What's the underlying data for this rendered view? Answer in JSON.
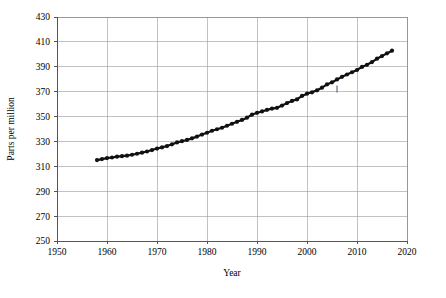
{
  "chart_data": {
    "type": "scatter",
    "title": "",
    "subtitle": "",
    "xlabel": "Year",
    "ylabel": "Parts per million",
    "xlim": [
      1950,
      2020
    ],
    "ylim": [
      250,
      430
    ],
    "xticks": [
      1950,
      1960,
      1970,
      1980,
      1990,
      2000,
      2010,
      2020
    ],
    "yticks": [
      250,
      270,
      290,
      310,
      330,
      350,
      370,
      390,
      410,
      430
    ],
    "xtick_labels": [
      "1950",
      "1960",
      "1970",
      "1980",
      "1990",
      "2000",
      "2010",
      "2020"
    ],
    "ytick_labels": [
      "250",
      "270",
      "290",
      "310",
      "330",
      "350",
      "370",
      "390",
      "410",
      "430"
    ],
    "grid": true,
    "legend": null,
    "legend_position": "none",
    "marker": "filled-circle",
    "marker_color": "#111111",
    "grid_color": "#9a9a9a",
    "axis_color": "#555555",
    "background": "#ffffff",
    "x": [
      1958,
      1959,
      1960,
      1961,
      1962,
      1963,
      1964,
      1965,
      1966,
      1967,
      1968,
      1969,
      1970,
      1971,
      1972,
      1973,
      1974,
      1975,
      1976,
      1977,
      1978,
      1979,
      1980,
      1981,
      1982,
      1983,
      1984,
      1985,
      1986,
      1987,
      1988,
      1989,
      1990,
      1991,
      1992,
      1993,
      1994,
      1995,
      1996,
      1997,
      1998,
      1999,
      2000,
      2001,
      2002,
      2003,
      2004,
      2005,
      2006,
      2007,
      2008,
      2009,
      2010,
      2011,
      2012,
      2013,
      2014,
      2015,
      2016,
      2017
    ],
    "values": [
      315,
      315.8,
      316.6,
      317.1,
      317.8,
      318.2,
      318.6,
      319.3,
      320.1,
      321.0,
      321.9,
      323.1,
      324.3,
      325.2,
      326.3,
      327.7,
      329.2,
      330.2,
      331.2,
      332.5,
      333.9,
      335.5,
      337.0,
      338.6,
      339.8,
      341.0,
      342.6,
      344.2,
      345.8,
      347.3,
      349.1,
      351.5,
      353.0,
      354.1,
      355.4,
      356.4,
      357.0,
      358.8,
      360.8,
      362.6,
      363.8,
      366.6,
      368.4,
      369.5,
      371.1,
      373.2,
      375.8,
      377.5,
      379.8,
      381.9,
      383.8,
      385.6,
      387.4,
      389.9,
      391.6,
      393.8,
      396.5,
      398.6,
      400.8,
      402.9
    ],
    "annotations": [
      {
        "label": "tick-mark",
        "x": 2006,
        "y": 372.5
      }
    ]
  }
}
